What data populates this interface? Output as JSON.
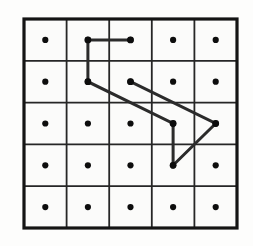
{
  "figure": {
    "background_color": "#fdfdfc",
    "canvas": {
      "width": 253,
      "height": 246
    }
  },
  "grid": {
    "rows": 5,
    "columns": 5,
    "left": 24,
    "top": 19,
    "right": 237,
    "bottom": 228,
    "cell_width": 42.6,
    "cell_height": 41.8,
    "outer_border_color": "#141414",
    "outer_border_width": 3.2,
    "inner_line_color": "#262626",
    "inner_line_width": 1.8,
    "cell_fill": "#fbfbfa",
    "vertical_line_x": [
      24,
      66.6,
      109.2,
      151.8,
      194.4,
      237
    ],
    "horizontal_line_y": [
      19,
      60.8,
      102.6,
      144.4,
      186.2,
      228
    ]
  },
  "dots": {
    "color": "#0d0d0d",
    "radius": 3.1,
    "count": 25,
    "centers": [
      {
        "row": 1,
        "col": 1,
        "x": 45.3,
        "y": 39.9
      },
      {
        "row": 1,
        "col": 2,
        "x": 87.9,
        "y": 39.9
      },
      {
        "row": 1,
        "col": 3,
        "x": 130.5,
        "y": 39.9
      },
      {
        "row": 1,
        "col": 4,
        "x": 173.1,
        "y": 39.9
      },
      {
        "row": 1,
        "col": 5,
        "x": 215.7,
        "y": 39.9
      },
      {
        "row": 2,
        "col": 1,
        "x": 45.3,
        "y": 81.7
      },
      {
        "row": 2,
        "col": 2,
        "x": 87.9,
        "y": 81.7
      },
      {
        "row": 2,
        "col": 3,
        "x": 130.5,
        "y": 81.7
      },
      {
        "row": 2,
        "col": 4,
        "x": 173.1,
        "y": 81.7
      },
      {
        "row": 2,
        "col": 5,
        "x": 215.7,
        "y": 81.7
      },
      {
        "row": 3,
        "col": 1,
        "x": 45.3,
        "y": 123.5
      },
      {
        "row": 3,
        "col": 2,
        "x": 87.9,
        "y": 123.5
      },
      {
        "row": 3,
        "col": 3,
        "x": 130.5,
        "y": 123.5
      },
      {
        "row": 3,
        "col": 4,
        "x": 173.1,
        "y": 123.5
      },
      {
        "row": 3,
        "col": 5,
        "x": 215.7,
        "y": 123.5
      },
      {
        "row": 4,
        "col": 1,
        "x": 45.3,
        "y": 165.3
      },
      {
        "row": 4,
        "col": 2,
        "x": 87.9,
        "y": 165.3
      },
      {
        "row": 4,
        "col": 3,
        "x": 130.5,
        "y": 165.3
      },
      {
        "row": 4,
        "col": 4,
        "x": 173.1,
        "y": 165.3
      },
      {
        "row": 4,
        "col": 5,
        "x": 215.7,
        "y": 165.3
      },
      {
        "row": 5,
        "col": 1,
        "x": 45.3,
        "y": 207.1
      },
      {
        "row": 5,
        "col": 2,
        "x": 87.9,
        "y": 207.1
      },
      {
        "row": 5,
        "col": 3,
        "x": 130.5,
        "y": 207.1
      },
      {
        "row": 5,
        "col": 4,
        "x": 173.1,
        "y": 207.1
      },
      {
        "row": 5,
        "col": 5,
        "x": 215.7,
        "y": 207.1
      }
    ]
  },
  "path": {
    "color": "#2b2b2b",
    "width": 3.0,
    "vertex_count": 7,
    "vertices_rc": [
      {
        "row": 1,
        "col": 3
      },
      {
        "row": 1,
        "col": 2
      },
      {
        "row": 2,
        "col": 2
      },
      {
        "row": 3,
        "col": 4
      },
      {
        "row": 4,
        "col": 4
      },
      {
        "row": 3,
        "col": 5
      },
      {
        "row": 2,
        "col": 3
      }
    ],
    "polyline_points": "130.5,39.9 87.9,39.9 87.9,81.7 173.1,123.5 173.1,165.3 215.7,123.5 130.5,81.7",
    "segments": [
      {
        "name": "horizontal-top",
        "from_rc": "r1c3",
        "to_rc": "r1c2",
        "orientation": "horizontal"
      },
      {
        "name": "vertical-left",
        "from_rc": "r1c2",
        "to_rc": "r2c2",
        "orientation": "vertical"
      },
      {
        "name": "diagonal-long-down-right",
        "from_rc": "r2c2",
        "to_rc": "r3c4",
        "orientation": "diagonal"
      },
      {
        "name": "vertical-middle",
        "from_rc": "r3c4",
        "to_rc": "r4c4",
        "orientation": "vertical"
      },
      {
        "name": "diagonal-up-right",
        "from_rc": "r4c4",
        "to_rc": "r3c5",
        "orientation": "diagonal"
      },
      {
        "name": "diagonal-long-up-left",
        "from_rc": "r3c5",
        "to_rc": "r2c3",
        "orientation": "diagonal"
      },
      {
        "name": "vertical-right",
        "from_rc": "r2c3",
        "to_rc": "r1c3",
        "orientation": "vertical"
      }
    ],
    "node_marker_radius": 3.4
  }
}
